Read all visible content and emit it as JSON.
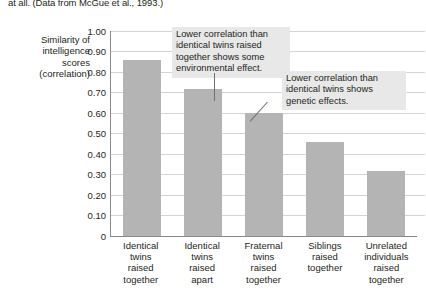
{
  "caption": "at all. (Data from McGue et al., 1993.)",
  "axis_title_lines": [
    "Similarity of",
    "intelligence",
    "scores",
    "(correlation)"
  ],
  "colors": {
    "bar": "#b4b4b4",
    "gridline": "#d4d4d4",
    "axis": "#8a8a8a",
    "annotation_bg": "#e8e8e8",
    "text": "#231f20"
  },
  "chart_data": {
    "type": "bar",
    "title": "",
    "xlabel": "",
    "ylabel": "Similarity of intelligence scores (correlation)",
    "ylim": [
      0,
      1.0
    ],
    "ytick_labels": [
      "1.00",
      "0.90",
      "0.80",
      "0.70",
      "0.60",
      "0.50",
      "0.40",
      "0.30",
      "0.20",
      "0.10",
      "0"
    ],
    "ytick_values": [
      1.0,
      0.9,
      0.8,
      0.7,
      0.6,
      0.5,
      0.4,
      0.3,
      0.2,
      0.1,
      0
    ],
    "grid": true,
    "legend": "none",
    "categories": [
      "Identical twins raised together",
      "Identical twins raised apart",
      "Fraternal twins raised together",
      "Siblings raised together",
      "Unrelated individuals raised together"
    ],
    "category_lines": [
      [
        "Identical",
        "twins",
        "raised",
        "together"
      ],
      [
        "Identical",
        "twins",
        "raised",
        "apart"
      ],
      [
        "Fraternal",
        "twins",
        "raised",
        "together"
      ],
      [
        "Siblings",
        "raised",
        "together"
      ],
      [
        "Unrelated",
        "individuals",
        "raised",
        "together"
      ]
    ],
    "values": [
      0.86,
      0.72,
      0.6,
      0.46,
      0.32
    ],
    "annotations": [
      {
        "text": "Lower correlation than identical twins raised together shows some environmental effect.",
        "lines": [
          "Lower correlation than",
          "identical twins raised",
          "together shows some",
          "environmental effect."
        ],
        "points_to": "Identical twins raised apart"
      },
      {
        "text": "Lower correlation than identical twins shows genetic effects.",
        "lines": [
          "Lower correlation than",
          "identical twins shows",
          "genetic effects."
        ],
        "points_to": "Fraternal twins raised together"
      }
    ]
  }
}
